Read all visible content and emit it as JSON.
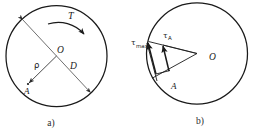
{
  "figure": {
    "type": "engineering-diagram",
    "background_color": "#ffffff",
    "line_color": "#1a1a1a",
    "panels": [
      {
        "id": "a",
        "caption": "a)",
        "description": "Circular cross-section with torque arrow, diameter D, radius rho to point A",
        "circle": {
          "cx": 56.5,
          "cy": 56,
          "r": 50.5
        },
        "labels": {
          "torque": "T",
          "center": "O",
          "diameter": "D",
          "radius": "ρ",
          "point": "A"
        }
      },
      {
        "id": "b",
        "caption": "b)",
        "description": "Shear stress vectors tau_max at outer surface and tau_A at interior point A",
        "circle": {
          "cx": 197,
          "cy": 53.5,
          "r": 50.5
        },
        "labels": {
          "tau_max_base": "τ",
          "tau_max_sub": "max",
          "tau_a_base": "τ",
          "tau_a_sub": "A",
          "center": "O",
          "point": "A"
        }
      }
    ]
  }
}
